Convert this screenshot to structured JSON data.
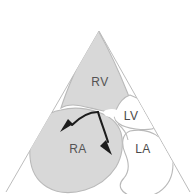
{
  "figure": {
    "type": "anatomical-sector-diagram",
    "modality": "echocardiography-four-chamber-view",
    "background_color": "#ffffff"
  },
  "sector": {
    "name": "ultrasound-sector",
    "apex_label": "",
    "edge_color": "#b4b4b4"
  },
  "chambers": [
    {
      "id": "rv",
      "label": "RV",
      "shaded": true,
      "fill_color": "#d8d8d8",
      "outline_color": "#b9b9b9",
      "label_x": 100,
      "label_y": 83
    },
    {
      "id": "lv",
      "label": "LV",
      "shaded": false,
      "fill_color": "#ffffff",
      "outline_color": "#b9b9b9",
      "label_x": 131,
      "label_y": 117
    },
    {
      "id": "ra",
      "label": "RA",
      "shaded": true,
      "fill_color": "#d8d8d8",
      "outline_color": "#b9b9b9",
      "label_x": 78,
      "label_y": 150
    },
    {
      "id": "la",
      "label": "LA",
      "shaded": false,
      "fill_color": "#ffffff",
      "outline_color": "#b9b9b9",
      "label_x": 143,
      "label_y": 150
    }
  ],
  "arrows": [
    {
      "id": "flow-arrow-left",
      "name": "flow-arrow-to-ra",
      "direction": "left-down",
      "color": "#1c1c1c"
    },
    {
      "id": "flow-arrow-right",
      "name": "flow-arrow-to-ra-lower",
      "direction": "right-down",
      "color": "#1c1c1c"
    }
  ],
  "colors": {
    "shaded_fill": "#d8d8d8",
    "open_fill": "#ffffff",
    "outline": "#b9b9b9",
    "sector_edge": "#b4b4b4",
    "label_text": "#4a4a4a",
    "arrow": "#1c1c1c",
    "background": "#ffffff"
  }
}
